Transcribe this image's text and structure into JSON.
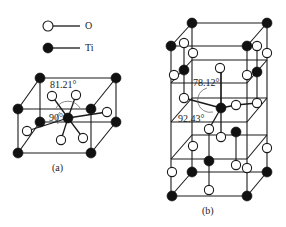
{
  "legend": {
    "items": [
      {
        "symbol": "open-circle",
        "label": "O"
      },
      {
        "symbol": "filled-circle",
        "label": "Ti"
      }
    ]
  },
  "panels": [
    {
      "id": "a",
      "caption": "(a)",
      "angles": [
        "81.21°",
        "90°"
      ]
    },
    {
      "id": "b",
      "caption": "(b)",
      "angles": [
        "78.12°",
        "92.43°"
      ]
    }
  ],
  "colors": {
    "ti": "#111111",
    "o": "#ffffff",
    "line": "#1a1a1a"
  }
}
